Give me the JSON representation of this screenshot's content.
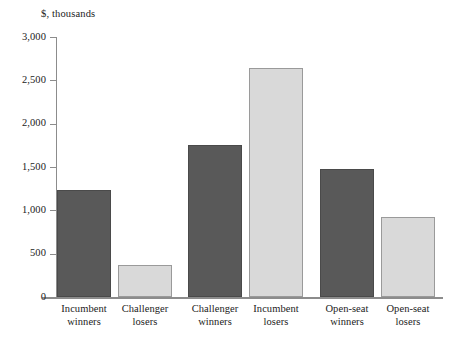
{
  "chart_data": {
    "type": "bar",
    "title": "",
    "unit_caption": "$, thousands",
    "xlabel": "",
    "ylabel": "$, thousands",
    "ylim": [
      0,
      3000
    ],
    "grid": false,
    "legend": "none",
    "categories": [
      "Incumbent winners",
      "Challenger losers",
      "Challenger winners",
      "Incumbent losers",
      "Open-seat winners",
      "Open-seat losers"
    ],
    "category_lines": [
      [
        "Incumbent",
        "winners"
      ],
      [
        "Challenger",
        "losers"
      ],
      [
        "Challenger",
        "winners"
      ],
      [
        "Incumbent",
        "losers"
      ],
      [
        "Open-seat",
        "winners"
      ],
      [
        "Open-seat",
        "losers"
      ]
    ],
    "values": [
      1235,
      370,
      1755,
      2640,
      1480,
      925
    ],
    "bar_colors": [
      "dark",
      "light",
      "dark",
      "light",
      "dark",
      "light"
    ],
    "ytick_labels": [
      "0",
      "500",
      "1,000",
      "1,500",
      "2,000",
      "2,500",
      "3,000"
    ],
    "ytick_values": [
      0,
      500,
      1000,
      1500,
      2000,
      2500,
      3000
    ],
    "colors": {
      "dark_bar": "#595959",
      "light_bar": "#d9d9d9",
      "axis": "#8c8c8c",
      "text": "#222222",
      "background": "#ffffff"
    },
    "bar_layout": [
      {
        "left": 0,
        "width": 54
      },
      {
        "left": 61,
        "width": 54
      },
      {
        "left": 131,
        "width": 54
      },
      {
        "left": 192,
        "width": 54
      },
      {
        "left": 263,
        "width": 54
      },
      {
        "left": 324,
        "width": 54
      }
    ]
  }
}
